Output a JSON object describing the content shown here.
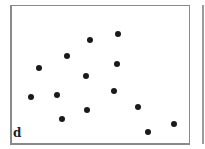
{
  "figure": {
    "panel_label": "d",
    "frame_color": "#8a8a8a",
    "dot_color": "#1a1a1a"
  },
  "chart_data": {
    "type": "scatter",
    "title": "",
    "xlabel": "",
    "ylabel": "",
    "panel_label": "d",
    "grid": false,
    "legend": null,
    "xlim": [
      10,
      188
    ],
    "ylim": [
      5,
      143
    ],
    "units": "pixel coordinates within image (y down)",
    "points": [
      {
        "x": 39,
        "y": 68
      },
      {
        "x": 67,
        "y": 56
      },
      {
        "x": 90,
        "y": 40
      },
      {
        "x": 118,
        "y": 34
      },
      {
        "x": 117,
        "y": 64
      },
      {
        "x": 86,
        "y": 76
      },
      {
        "x": 31,
        "y": 97
      },
      {
        "x": 57,
        "y": 95
      },
      {
        "x": 114,
        "y": 91
      },
      {
        "x": 87,
        "y": 110
      },
      {
        "x": 62,
        "y": 119
      },
      {
        "x": 138,
        "y": 107
      },
      {
        "x": 148,
        "y": 132
      },
      {
        "x": 174,
        "y": 124
      }
    ]
  }
}
